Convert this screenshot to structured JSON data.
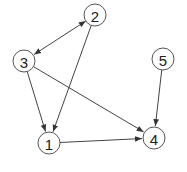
{
  "diagram": {
    "type": "directed-graph",
    "nodes": [
      {
        "id": "1",
        "label": "1",
        "x": 49,
        "y": 143
      },
      {
        "id": "2",
        "label": "2",
        "x": 95,
        "y": 15
      },
      {
        "id": "3",
        "label": "3",
        "x": 24,
        "y": 61
      },
      {
        "id": "4",
        "label": "4",
        "x": 154,
        "y": 138
      },
      {
        "id": "5",
        "label": "5",
        "x": 163,
        "y": 59
      }
    ],
    "edges": [
      {
        "from": "2",
        "to": "3",
        "bidirectional": true
      },
      {
        "from": "2",
        "to": "1",
        "bidirectional": false
      },
      {
        "from": "3",
        "to": "1",
        "bidirectional": false
      },
      {
        "from": "3",
        "to": "4",
        "bidirectional": false
      },
      {
        "from": "1",
        "to": "4",
        "bidirectional": false
      },
      {
        "from": "5",
        "to": "4",
        "bidirectional": false
      }
    ],
    "node_radius": 11,
    "colors": {
      "stroke": "#555555",
      "edge": "#444444",
      "fill": "#ffffff",
      "text": "#222222"
    }
  }
}
